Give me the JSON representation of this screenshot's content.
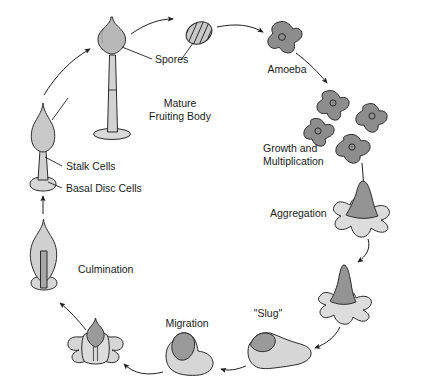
{
  "diagram": {
    "type": "cycle-diagram",
    "background_color": "#ffffff",
    "outline_color": "#2b2b2b",
    "label_color": "#1a1a1a",
    "fill_light": "#d8d8d8",
    "fill_mid": "#c2c2c2",
    "fill_dark": "#8d8d8d",
    "fill_darker": "#7f7f7f"
  },
  "labels": {
    "spores": "Spores",
    "mature_fruiting_body_line1": "Mature",
    "mature_fruiting_body_line2": "Fruiting Body",
    "stalk_cells": "Stalk Cells",
    "basal_disc_cells": "Basal Disc Cells",
    "amoeba": "Amoeba",
    "growth_line1": "Growth and",
    "growth_line2": "Multiplication",
    "aggregation": "Aggregation",
    "slug": "\"Slug\"",
    "migration": "Migration",
    "culmination": "Culmination"
  },
  "stages": [
    {
      "id": "mature-fruiting-body",
      "label": "Mature Fruiting Body",
      "order": 1
    },
    {
      "id": "spores",
      "label": "Spores",
      "order": 2
    },
    {
      "id": "amoeba",
      "label": "Amoeba",
      "order": 3
    },
    {
      "id": "growth-multiplication",
      "label": "Growth and Multiplication",
      "order": 4
    },
    {
      "id": "aggregation",
      "label": "Aggregation",
      "order": 5
    },
    {
      "id": "tipped-mound",
      "label": "Tipped Mound",
      "order": 6
    },
    {
      "id": "slug",
      "label": "\"Slug\"",
      "order": 7
    },
    {
      "id": "migration",
      "label": "Migration",
      "order": 8
    },
    {
      "id": "culmination",
      "label": "Culmination",
      "order": 9
    },
    {
      "id": "early-fruiting-body",
      "label": "Early Fruiting Body",
      "order": 10
    }
  ]
}
